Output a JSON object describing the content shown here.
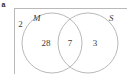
{
  "figure": {
    "part_label": "a",
    "type": "venn-diagram",
    "stroke_color": "#b0b0b0",
    "box_stroke_color": "#b9b9b9",
    "text_color": "#3a3a3a"
  },
  "universe": {
    "outside_count": "2"
  },
  "sets": [
    {
      "key": "M",
      "label": "M",
      "position": "left"
    },
    {
      "key": "S",
      "label": "S",
      "position": "right"
    }
  ],
  "regions": [
    {
      "key": "m-only",
      "value": "28"
    },
    {
      "key": "m-and-s",
      "value": "7"
    },
    {
      "key": "s-only",
      "value": "3"
    }
  ]
}
